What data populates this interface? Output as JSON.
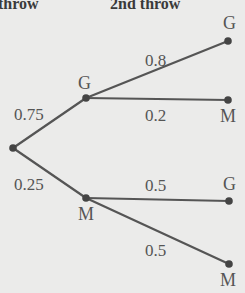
{
  "headers": {
    "first": "throw",
    "second": "2nd throw"
  },
  "tree": {
    "root": {
      "x": 13,
      "y": 148
    },
    "level1": [
      {
        "label": "G",
        "prob": "0.75",
        "x": 86,
        "y": 98
      },
      {
        "label": "M",
        "prob": "0.25",
        "x": 86,
        "y": 198
      }
    ],
    "level2": [
      {
        "parent": "G",
        "label": "G",
        "prob": "0.8",
        "x": 228,
        "y": 41
      },
      {
        "parent": "G",
        "label": "M",
        "prob": "0.2",
        "x": 228,
        "y": 100
      },
      {
        "parent": "M",
        "label": "G",
        "prob": "0.5",
        "x": 229,
        "y": 201
      },
      {
        "parent": "M",
        "label": "M",
        "prob": "0.5",
        "x": 229,
        "y": 264
      }
    ]
  },
  "colors": {
    "background": "#ebebea",
    "line": "#555555",
    "text": "#555555"
  }
}
